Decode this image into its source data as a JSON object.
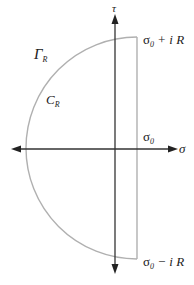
{
  "diagram": {
    "axes": {
      "horizontal_label": "σ",
      "vertical_label": "τ"
    },
    "contour": {
      "region_label_main": "Γ",
      "region_label_sub": "R",
      "arc_label_main": "C",
      "arc_label_sub": "R"
    },
    "points": {
      "top": {
        "main": "σ",
        "sub": "0",
        "rest": " + i R"
      },
      "middle": {
        "main": "σ",
        "sub": "0"
      },
      "bottom": {
        "main": "σ",
        "sub": "0",
        "rest": " − i R"
      }
    },
    "colors": {
      "axis": "#222222",
      "contour": "#b0b0b0"
    }
  }
}
